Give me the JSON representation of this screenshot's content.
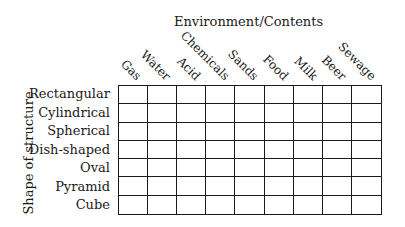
{
  "title": "Environment/Contents",
  "axis_label": "Shape of structure",
  "columns": [
    "Gas",
    "Water",
    "Acid",
    "Chemicals",
    "Sands",
    "Food",
    "Milk",
    "Beer",
    "Sewage"
  ],
  "rows": [
    "Rectangular",
    "Cylindrical",
    "Spherical",
    "Dish-shaped",
    "Oval",
    "Pyramid",
    "Cube"
  ],
  "cells": "empty 7x9 grid"
}
